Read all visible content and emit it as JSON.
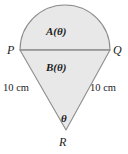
{
  "figure": {
    "type": "geometry-diagram",
    "background_color": "#ffffff",
    "fill_color": "#e8e8e8",
    "stroke_color": "#8a8a8a",
    "text_color": "#1c1c1c",
    "labels": {
      "vertex_p": "P",
      "vertex_q": "Q",
      "vertex_r": "R",
      "region_upper": "A(θ)",
      "region_lower": "B(θ)",
      "side_left_length": "10 cm",
      "side_right_length": "10 cm",
      "apex_angle": "θ"
    },
    "geometry": {
      "semicircle_center": [
        65,
        50
      ],
      "semicircle_radius": 45,
      "point_p": [
        20,
        50
      ],
      "point_q": [
        110,
        50
      ],
      "point_r": [
        66,
        130
      ],
      "chord_pq_y": 50
    }
  }
}
